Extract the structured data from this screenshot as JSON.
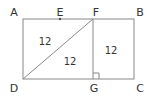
{
  "diagram": {
    "type": "geometry",
    "points": {
      "A": {
        "label": "A",
        "x": 23,
        "y": 19
      },
      "E": {
        "label": "E",
        "x": 60,
        "y": 19
      },
      "F": {
        "label": "F",
        "x": 93,
        "y": 19
      },
      "B": {
        "label": "B",
        "x": 134,
        "y": 19
      },
      "D": {
        "label": "D",
        "x": 23,
        "y": 79
      },
      "G": {
        "label": "G",
        "x": 93,
        "y": 79
      },
      "C": {
        "label": "C",
        "x": 134,
        "y": 79
      }
    },
    "label_positions": {
      "A": {
        "x": 14,
        "y": 12
      },
      "E": {
        "x": 60,
        "y": 12
      },
      "F": {
        "x": 96,
        "y": 12
      },
      "B": {
        "x": 140,
        "y": 12
      },
      "D": {
        "x": 14,
        "y": 88
      },
      "G": {
        "x": 94,
        "y": 88
      },
      "C": {
        "x": 140,
        "y": 88
      }
    },
    "segments": [
      "AB",
      "BC",
      "CD",
      "DA",
      "FG",
      "DF"
    ],
    "right_angle_at": "G",
    "region_labels": [
      {
        "region": "triangle ADF",
        "text": "12",
        "x": 45,
        "y": 42
      },
      {
        "region": "triangle DFG",
        "text": "12",
        "x": 70,
        "y": 62
      },
      {
        "region": "rectangle FBCG",
        "text": "12",
        "x": 111,
        "y": 51
      }
    ],
    "line_color": "#888888",
    "text_color": "#333333"
  }
}
